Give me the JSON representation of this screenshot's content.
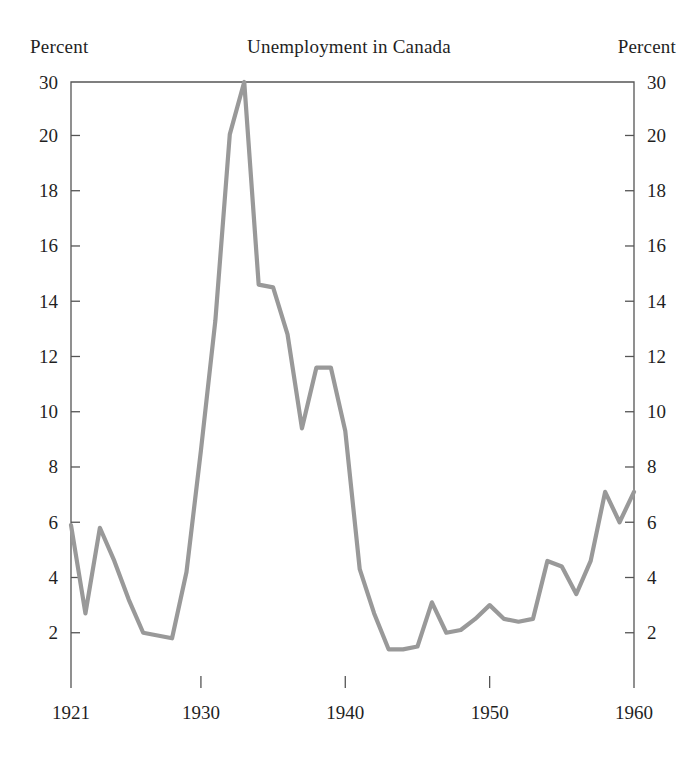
{
  "chart_data": {
    "type": "line",
    "title": "Unemployment in Canada",
    "xlabel": "",
    "ylabel": "Percent",
    "ylabel_right": "Percent",
    "unit_label_left": "Percent",
    "unit_label_right": "Percent",
    "grid": false,
    "legend": null,
    "line_color": "#999999",
    "axis_color": "#555555",
    "xlim": [
      1921,
      1960
    ],
    "ylim": [
      0,
      30
    ],
    "y_axis_note": "Axis is linear from 0 to 20 then compressed; the 20-to-30 interval occupies the same span as a 2-point interval.",
    "yticks": [
      2,
      4,
      6,
      8,
      10,
      12,
      14,
      16,
      18,
      20,
      30
    ],
    "ytick_labels": [
      "2",
      "4",
      "6",
      "8",
      "10",
      "12",
      "14",
      "16",
      "18",
      "20",
      "30"
    ],
    "xticks": [
      1921,
      1930,
      1940,
      1950,
      1960
    ],
    "xtick_labels": [
      "1921",
      "1930",
      "1940",
      "1950",
      "1960"
    ],
    "x": [
      1921,
      1922,
      1923,
      1924,
      1925,
      1926,
      1927,
      1928,
      1929,
      1930,
      1931,
      1932,
      1933,
      1934,
      1935,
      1936,
      1937,
      1938,
      1939,
      1940,
      1941,
      1942,
      1943,
      1944,
      1945,
      1946,
      1947,
      1948,
      1949,
      1950,
      1951,
      1952,
      1953,
      1954,
      1955,
      1956,
      1957,
      1958,
      1959,
      1960
    ],
    "values": [
      5.9,
      2.7,
      5.8,
      4.6,
      3.2,
      2.0,
      1.9,
      1.8,
      4.2,
      8.6,
      13.3,
      20.2,
      30.0,
      14.6,
      14.5,
      12.8,
      9.4,
      11.6,
      11.6,
      9.3,
      4.3,
      2.7,
      1.4,
      1.4,
      1.5,
      3.1,
      2.0,
      2.1,
      2.5,
      3.0,
      2.5,
      2.4,
      2.5,
      4.6,
      4.4,
      3.4,
      4.6,
      7.1,
      6.0,
      7.1
    ],
    "annotations": []
  }
}
